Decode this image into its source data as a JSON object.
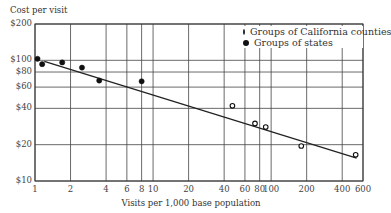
{
  "chart_data": {
    "type": "scatter",
    "title": "",
    "ylabel": "Cost per visit",
    "xlabel": "Visits per 1,000 base population",
    "xscale": "log",
    "yscale": "log",
    "xlim": [
      1,
      600
    ],
    "ylim": [
      10,
      200
    ],
    "x_ticks": [
      1,
      2,
      4,
      6,
      8,
      10,
      20,
      40,
      60,
      80,
      100,
      200,
      400,
      600
    ],
    "x_tick_labels": [
      "1",
      "2",
      "4",
      "6",
      "8",
      "10",
      "20",
      "40",
      "60",
      "80",
      "100",
      "200",
      "400",
      "600"
    ],
    "y_ticks": [
      10,
      20,
      40,
      60,
      80,
      100,
      200
    ],
    "y_tick_labels": [
      "$10",
      "$20",
      "$40",
      "$60",
      "$80",
      "$100",
      "$200"
    ],
    "grid": true,
    "legend_position": "upper right",
    "series": [
      {
        "name": "Groups of California counties",
        "marker": "open-circle",
        "points": [
          {
            "x": 47,
            "y": 42
          },
          {
            "x": 73,
            "y": 30
          },
          {
            "x": 90,
            "y": 28
          },
          {
            "x": 180,
            "y": 19.5
          },
          {
            "x": 520,
            "y": 16.5
          }
        ]
      },
      {
        "name": "Groups of states",
        "marker": "filled-circle",
        "points": [
          {
            "x": 1.05,
            "y": 103
          },
          {
            "x": 1.15,
            "y": 93
          },
          {
            "x": 1.7,
            "y": 96
          },
          {
            "x": 2.5,
            "y": 87
          },
          {
            "x": 3.5,
            "y": 68
          },
          {
            "x": 8.0,
            "y": 67
          }
        ]
      },
      {
        "name": "Trend line",
        "type": "line",
        "points": [
          {
            "x": 1.2,
            "y": 98
          },
          {
            "x": 530,
            "y": 15.5
          }
        ]
      }
    ]
  },
  "labels": {
    "y_title": "Cost per visit",
    "x_title": "Visits per 1,000 base population",
    "legend": [
      {
        "label": "Groups of California counties",
        "marker": "open-circle"
      },
      {
        "label": "Groups of states",
        "marker": "filled-circle"
      }
    ]
  }
}
